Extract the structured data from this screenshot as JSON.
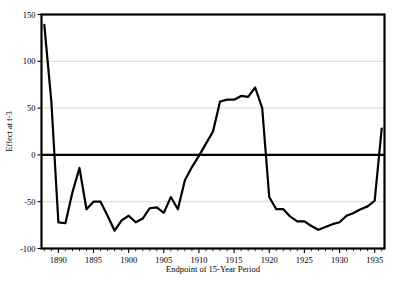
{
  "chart_data": {
    "type": "line",
    "title": "",
    "xlabel": "Endpoint of 15-Year Period",
    "ylabel": "Effect at t-3",
    "xlim": [
      1887.6,
      1936.4
    ],
    "ylim": [
      -100,
      150
    ],
    "xticks": [
      1890,
      1895,
      1900,
      1905,
      1910,
      1915,
      1920,
      1925,
      1930,
      1935
    ],
    "xtick_labels": [
      "1890",
      "1895",
      "1900",
      "1905",
      "1910",
      "1915",
      "1920",
      "1925",
      "1930",
      "1935"
    ],
    "yticks": [
      -100,
      -50,
      0,
      50,
      100,
      150
    ],
    "ytick_labels": [
      "-100",
      "-50",
      "0",
      "50",
      "100",
      "150"
    ],
    "grid": "horizontal",
    "legend": "none",
    "zero_reference_line": 0,
    "line_color": "#000000",
    "grid_color": "#c9c9c9",
    "x": [
      1888,
      1889,
      1890,
      1891,
      1892,
      1893,
      1894,
      1895,
      1896,
      1897,
      1898,
      1899,
      1900,
      1901,
      1902,
      1903,
      1904,
      1905,
      1906,
      1907,
      1908,
      1909,
      1910,
      1911,
      1912,
      1913,
      1914,
      1915,
      1916,
      1917,
      1918,
      1919,
      1920,
      1921,
      1922,
      1923,
      1924,
      1925,
      1926,
      1927,
      1928,
      1929,
      1930,
      1931,
      1932,
      1933,
      1934,
      1935,
      1936
    ],
    "values": [
      139,
      57,
      -72,
      -73,
      -40,
      -14,
      -58,
      -50,
      -50,
      -65,
      -81,
      -70,
      -65,
      -72,
      -68,
      -57,
      -56,
      -62,
      -45,
      -58,
      -27,
      -13,
      -1,
      12,
      25,
      57,
      59,
      59,
      63,
      62,
      72,
      50,
      -45,
      -58,
      -58,
      -66,
      -71,
      -71,
      -76,
      -80,
      -77,
      -74,
      -72,
      -65,
      -62,
      -58,
      -55,
      -49,
      28
    ],
    "series": [
      {
        "name": "Effect at t-3",
        "values": [
          139,
          57,
          -72,
          -73,
          -40,
          -14,
          -58,
          -50,
          -50,
          -65,
          -81,
          -70,
          -65,
          -72,
          -68,
          -57,
          -56,
          -62,
          -45,
          -58,
          -27,
          -13,
          -1,
          12,
          25,
          57,
          59,
          59,
          63,
          62,
          72,
          50,
          -45,
          -58,
          -58,
          -66,
          -71,
          -71,
          -76,
          -80,
          -77,
          -74,
          -72,
          -65,
          -62,
          -58,
          -55,
          -49,
          28
        ]
      }
    ],
    "annotations": []
  }
}
